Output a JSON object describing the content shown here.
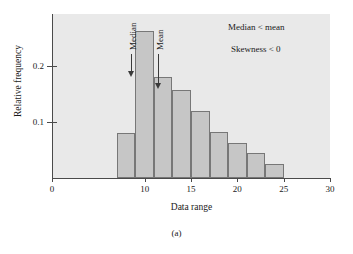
{
  "chart_data": {
    "type": "bar",
    "title": "",
    "subtitle": "",
    "xlabel": "Data range",
    "ylabel": "Relative frequency",
    "xlim": [
      0,
      30
    ],
    "ylim": [
      0,
      0.29
    ],
    "grid": false,
    "legend": null,
    "bin_width": 2,
    "bin_edges": [
      7,
      9,
      11,
      13,
      15,
      17,
      19,
      21,
      23,
      25
    ],
    "categories": [
      "7-9",
      "9-11",
      "11-13",
      "13-15",
      "15-17",
      "17-19",
      "19-21",
      "21-23",
      "23-25"
    ],
    "bin_centers": [
      8,
      10,
      12,
      14,
      16,
      18,
      20,
      22,
      24
    ],
    "values": [
      0.08,
      0.263,
      0.18,
      0.158,
      0.12,
      0.082,
      0.062,
      0.045,
      0.025
    ],
    "xticks": [
      0,
      10,
      15,
      20,
      25,
      30
    ],
    "xtick_labels": [
      "0",
      "10",
      "15",
      "20",
      "25",
      "30"
    ],
    "yticks": [
      0.1,
      0.2
    ],
    "ytick_labels": [
      "0.1",
      "0.2"
    ],
    "annotations": [
      {
        "text": "Median < mean",
        "x": 23.0,
        "y": 0.268
      },
      {
        "text": "Skewness < 0",
        "x": 23.0,
        "y": 0.238
      },
      {
        "text": "Median",
        "x": 12.4,
        "y": 0.18,
        "type": "arrow-down"
      },
      {
        "text": "Mean",
        "x": 14.4,
        "y": 0.158,
        "type": "arrow-down"
      }
    ],
    "caption": "(a)",
    "colors": {
      "bar_fill": "#c6c6c6",
      "bar_edge": "#777777",
      "plot_background": "#e9e9e9",
      "axis": "#4a4a4a",
      "text": "#1a1a1a",
      "arrow": "#3a3a3a"
    }
  }
}
